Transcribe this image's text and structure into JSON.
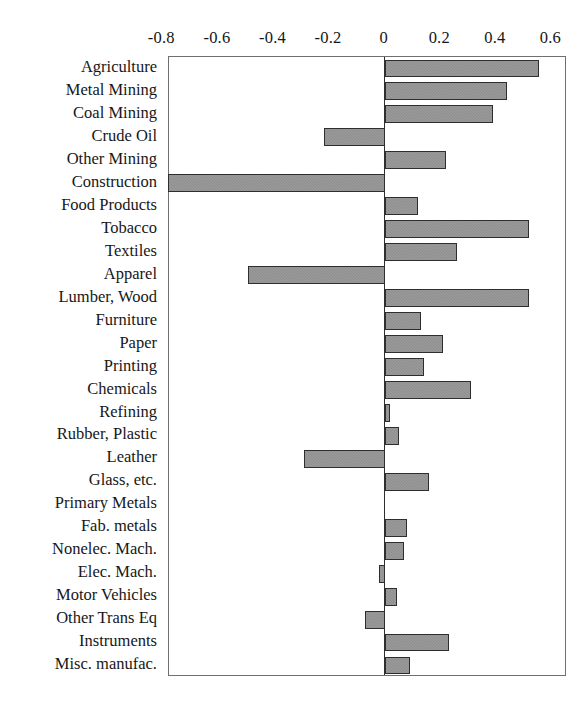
{
  "chart_data": {
    "type": "bar",
    "orientation": "horizontal",
    "title": "",
    "subtitle": "",
    "xlabel": "",
    "ylabel": "",
    "xlim": [
      -0.776,
      0.656
    ],
    "xticks": [
      -0.8,
      -0.6,
      -0.4,
      -0.2,
      0,
      0.2,
      0.4,
      0.6
    ],
    "xtick_labels": [
      "-0.8",
      "-0.6",
      "-0.4",
      "-0.2",
      "0",
      "0.2",
      "0.4",
      "0.6"
    ],
    "grid": false,
    "legend": null,
    "axis_position": "top",
    "zero_reference": 0,
    "bar_color": "#8d8d8d",
    "bar_edge_color": "#2e2e2e",
    "frame_color": "#6f6f6f",
    "categories": [
      "Agriculture",
      "Metal Mining",
      "Coal Mining",
      "Crude Oil",
      "Other Mining",
      "Construction",
      "Food Products",
      "Tobacco",
      "Textiles",
      "Apparel",
      "Lumber, Wood",
      "Furniture",
      "Paper",
      "Printing",
      "Chemicals",
      "Refining",
      "Rubber, Plastic",
      "Leather",
      "Glass, etc.",
      "Primary Metals",
      "Fab. metals",
      "Nonelec. Mach.",
      "Elec. Mach.",
      "Motor Vehicles",
      "Other Trans Eq",
      "Instruments",
      "Misc. manufac."
    ],
    "values": [
      0.555,
      0.44,
      0.39,
      -0.22,
      0.22,
      -0.78,
      0.12,
      0.52,
      0.26,
      -0.49,
      0.52,
      0.13,
      0.21,
      0.14,
      0.31,
      0.02,
      0.05,
      -0.29,
      0.16,
      0.0,
      0.08,
      0.07,
      -0.02,
      0.045,
      -0.07,
      0.23,
      0.09
    ]
  }
}
